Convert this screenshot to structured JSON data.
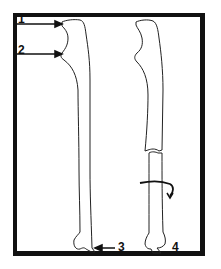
{
  "diagram": {
    "type": "anatomical-bone-illustration",
    "panels": [
      {
        "name": "intact-bone",
        "description": "Intact ulna with labeled landmarks"
      },
      {
        "name": "fractured-bone",
        "description": "Ulna with mid-shaft fracture and rotation arrow"
      }
    ],
    "labels": [
      {
        "id": "1",
        "text": "1"
      },
      {
        "id": "2",
        "text": "2"
      },
      {
        "id": "3",
        "text": "3"
      },
      {
        "id": "4",
        "text": "4"
      }
    ],
    "colors": {
      "line": "#111111",
      "background": "#ffffff",
      "frame": "#111111"
    }
  }
}
